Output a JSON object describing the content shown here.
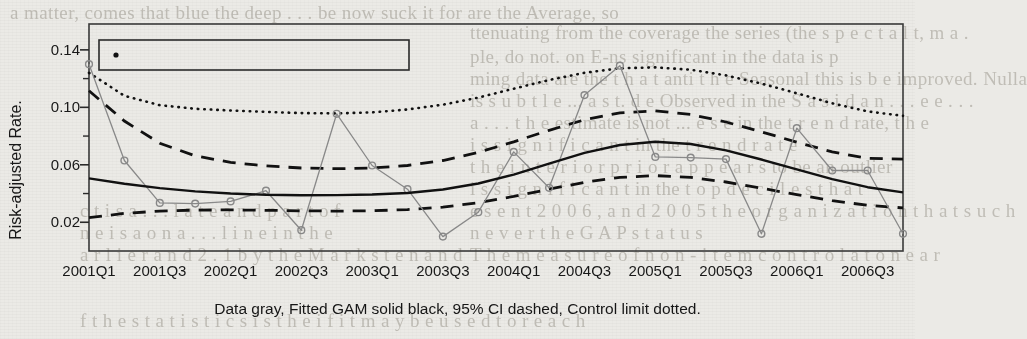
{
  "figure": {
    "ylabel": "Risk-adjusted Rate.",
    "caption": "Data gray, Fitted GAM solid black, 95% CI dashed, Control limit dotted.",
    "legend_label": "Seasonal Trend Test p-value 0.5516"
  },
  "ghost_text": [
    {
      "x": 10,
      "y": 2,
      "t": "a matter, comes that blue the deep . . . be now suck  it for  are the Average, so"
    },
    {
      "x": 470,
      "y": 22,
      "t": "ttenuating from the coverage the series (the s p e c t a l  t, m a ."
    },
    {
      "x": 470,
      "y": 46,
      "t": "ple, do not. on E-ns significant in the data is p"
    },
    {
      "x": 470,
      "y": 68,
      "t": "ming data are the  t h a t  anti  t h e  Seasonal  this  is  b e  improved.  Nulla"
    },
    {
      "x": 470,
      "y": 90,
      "t": "is  s u b t l e  ...  a s  t. d e  Observed in the  S a s  i d  a n  . . .  e e . . ."
    },
    {
      "x": 470,
      "y": 112,
      "t": "a   . . .   t h e  estimate  is  not  ...  e s e  in  the  t r e n d  rate,  t h e"
    },
    {
      "x": 470,
      "y": 134,
      "t": "i s  s i g n i f i c a n t   in  the  t r e n d  r a t e"
    },
    {
      "x": 470,
      "y": 156,
      "t": "t h e  i n t e r i o r  p r i o r   a p p e a r s  to  be  an  outlier"
    },
    {
      "x": 470,
      "y": 178,
      "t": "i s  s i g n i f i c a n t   in  the  t o p  d e c i l e s  t h a t"
    },
    {
      "x": 470,
      "y": 200,
      "t": "e s e n t  2 0 0 6 ,  a n d  2 0 0 5  t h e  o r g a n i z a t i o n  t h a t  s u c h"
    },
    {
      "x": 470,
      "y": 222,
      "t": "n e v e r  t h e  G A P  s t a t u s"
    },
    {
      "x": 470,
      "y": 244,
      "t": "T h e  m e a s u r e  o f  n o n - i t e m  c o n t r o l  a t  o n e  a r"
    },
    {
      "x": 80,
      "y": 200,
      "t": "c t  i s  a  . . .  l a t e  a n d  p a r t  o f"
    },
    {
      "x": 80,
      "y": 222,
      "t": "n e  i s  a  o n  a  . . . l i n e  i n  t h e"
    },
    {
      "x": 80,
      "y": 244,
      "t": "a r l i e r  a n d  2 . 1  b y  t h e  M a r k s t e n  a n d"
    },
    {
      "x": 80,
      "y": 310,
      "t": "f  t h e  s t a t i s t i c s  i s  t h e  i f  i t  m a y  b e  u s e d  t o  r e a c h"
    }
  ],
  "chart_data": {
    "type": "line",
    "title": "",
    "xlabel": "",
    "ylabel": "Risk-adjusted Rate.",
    "grid": false,
    "legend_position": "top-left",
    "xlim": [
      0,
      23
    ],
    "ylim": [
      0.0,
      0.158
    ],
    "yticks_major": [
      0.02,
      0.06,
      0.1,
      0.14
    ],
    "yticks_major_labels": [
      "0.02",
      "0.06",
      "0.10",
      "0.14"
    ],
    "yticks_minor": [
      0.04,
      0.08,
      0.12
    ],
    "x_all": [
      "2001Q1",
      "2001Q2",
      "2001Q3",
      "2001Q4",
      "2002Q1",
      "2002Q2",
      "2002Q3",
      "2002Q4",
      "2003Q1",
      "2003Q2",
      "2003Q3",
      "2003Q4",
      "2004Q1",
      "2004Q2",
      "2004Q3",
      "2004Q4",
      "2005Q1",
      "2005Q2",
      "2005Q3",
      "2005Q4",
      "2006Q1",
      "2006Q2",
      "2006Q3",
      "2006Q4"
    ],
    "xtick_labels": [
      "2001Q1",
      "2001Q3",
      "2002Q1",
      "2002Q3",
      "2003Q1",
      "2003Q3",
      "2004Q1",
      "2004Q3",
      "2005Q1",
      "2005Q3",
      "2006Q1",
      "2006Q3"
    ],
    "xtick_indices": [
      0,
      2,
      4,
      6,
      8,
      10,
      12,
      14,
      16,
      18,
      20,
      22
    ],
    "series": [
      {
        "name": "Data",
        "style": "solid-gray-with-open-circles",
        "color": "#8a8a8a",
        "values": [
          0.13,
          0.063,
          0.0335,
          0.033,
          0.0345,
          0.042,
          0.0145,
          0.0955,
          0.0595,
          0.043,
          0.01,
          0.027,
          0.069,
          0.044,
          0.1085,
          0.129,
          0.0655,
          0.065,
          0.064,
          0.012,
          0.0855,
          0.056,
          0.056,
          0.012
        ]
      },
      {
        "name": "Fitted GAM",
        "style": "solid-black",
        "color": "#111111",
        "values": [
          0.0505,
          0.0468,
          0.0438,
          0.0415,
          0.04,
          0.0391,
          0.0388,
          0.0389,
          0.0393,
          0.0404,
          0.0428,
          0.047,
          0.0532,
          0.0608,
          0.0683,
          0.0738,
          0.076,
          0.0745,
          0.07,
          0.0637,
          0.0568,
          0.05,
          0.0444,
          0.0408
        ]
      },
      {
        "name": "95% CI upper",
        "style": "dashed-black",
        "color": "#111111",
        "values": [
          0.1115,
          0.0905,
          0.075,
          0.0662,
          0.0617,
          0.0592,
          0.0578,
          0.0573,
          0.0578,
          0.0595,
          0.063,
          0.0686,
          0.076,
          0.084,
          0.0913,
          0.0962,
          0.0975,
          0.095,
          0.0898,
          0.083,
          0.0757,
          0.069,
          0.0645,
          0.064
        ]
      },
      {
        "name": "95% CI lower",
        "style": "dashed-black",
        "color": "#111111",
        "values": [
          0.0232,
          0.0262,
          0.0278,
          0.0285,
          0.0286,
          0.0283,
          0.028,
          0.0278,
          0.028,
          0.0288,
          0.0305,
          0.0336,
          0.038,
          0.043,
          0.0478,
          0.0512,
          0.0525,
          0.0512,
          0.048,
          0.0438,
          0.0392,
          0.035,
          0.0318,
          0.03
        ]
      },
      {
        "name": "Control limit",
        "style": "dotted-black",
        "color": "#111111",
        "values": [
          0.124,
          0.108,
          0.1015,
          0.099,
          0.0978,
          0.0968,
          0.096,
          0.0958,
          0.0965,
          0.0985,
          0.1018,
          0.1068,
          0.113,
          0.119,
          0.124,
          0.1272,
          0.1278,
          0.1262,
          0.1222,
          0.1165,
          0.1098,
          0.1028,
          0.0972,
          0.094
        ]
      }
    ]
  }
}
